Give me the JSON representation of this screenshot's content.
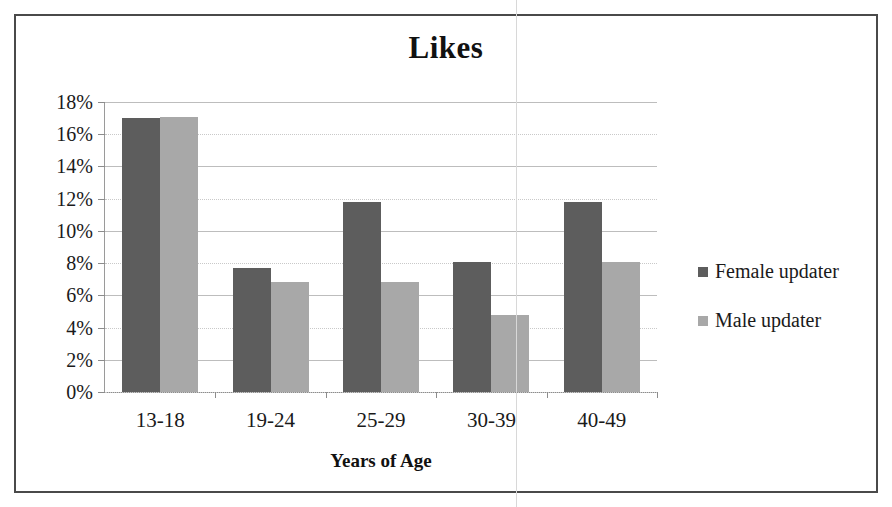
{
  "frame": {
    "border_color": "#4a4a4a",
    "scan_line_x": 516
  },
  "chart_data": {
    "type": "bar",
    "title": "Likes",
    "xlabel": "Years of Age",
    "ylabel": "",
    "categories": [
      "13-18",
      "19-24",
      "25-29",
      "30-39",
      "40-49"
    ],
    "series": [
      {
        "name": "Female updater",
        "color": "#5d5d5d",
        "values": [
          17.0,
          7.7,
          11.8,
          8.1,
          11.8
        ]
      },
      {
        "name": "Male updater",
        "color": "#a8a8a8",
        "values": [
          17.1,
          6.8,
          6.8,
          4.8,
          8.1
        ]
      }
    ],
    "ylim": [
      0,
      18
    ],
    "ytick_values": [
      0,
      2,
      4,
      6,
      8,
      10,
      12,
      14,
      16,
      18
    ],
    "ytick_labels": [
      "0%",
      "2%",
      "4%",
      "6%",
      "8%",
      "10%",
      "12%",
      "14%",
      "16%",
      "18%"
    ],
    "grid": true,
    "grid_axis": "y",
    "legend_position": "right",
    "value_suffix": "%",
    "bar_group_gap": true
  },
  "legend": {
    "entries": [
      {
        "label": "Female updater",
        "color": "#5d5d5d"
      },
      {
        "label": "Male updater",
        "color": "#a8a8a8"
      }
    ]
  }
}
